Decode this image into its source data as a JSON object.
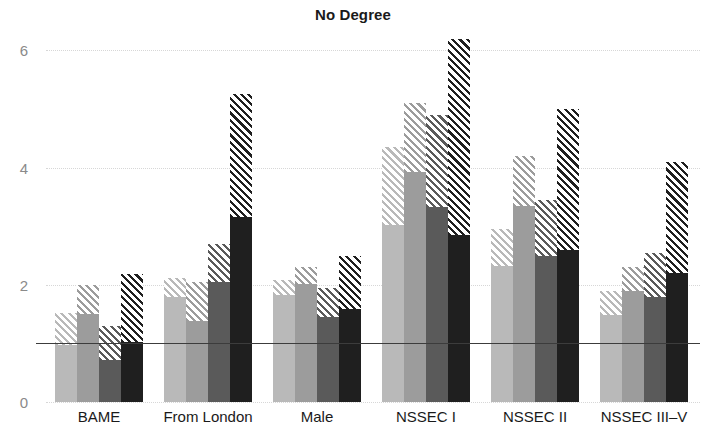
{
  "chart_data": {
    "type": "bar",
    "title": "No Degree",
    "xlabel": "",
    "ylabel": "",
    "ylim": [
      0,
      6.45
    ],
    "yticks": [
      0,
      2,
      4,
      6
    ],
    "ytick_labels": [
      "0",
      "2",
      "4",
      "6"
    ],
    "grid": "horizontal-dotted",
    "legend": "none",
    "reference_line": {
      "value": 1.0,
      "style": "solid",
      "color": "#3c3c3c"
    },
    "categories": [
      "BAME",
      "From London",
      "Male",
      "NSSEC I",
      "NSSEC II",
      "NSSEC III–V"
    ],
    "series": [
      {
        "name": "Series 1",
        "color": "#b9b9b9",
        "values": [
          0.98,
          1.8,
          1.82,
          3.02,
          2.32,
          1.48
        ],
        "upper": [
          1.52,
          2.12,
          2.08,
          4.35,
          2.95,
          1.9
        ]
      },
      {
        "name": "Series 2",
        "color": "#9c9c9c",
        "values": [
          1.5,
          1.38,
          2.02,
          3.92,
          3.35,
          1.9
        ],
        "upper": [
          2.0,
          2.05,
          2.3,
          5.1,
          4.2,
          2.3
        ]
      },
      {
        "name": "Series 3",
        "color": "#5a5a5a",
        "values": [
          0.72,
          2.05,
          1.45,
          3.32,
          2.5,
          1.8
        ],
        "upper": [
          1.3,
          2.7,
          1.95,
          4.9,
          3.45,
          2.55
        ]
      },
      {
        "name": "Series 4",
        "color": "#1f1f1f",
        "values": [
          1.03,
          3.15,
          1.58,
          2.85,
          2.6,
          2.2
        ],
        "upper": [
          2.18,
          5.25,
          2.5,
          6.19,
          5.0,
          4.1
        ]
      }
    ]
  }
}
